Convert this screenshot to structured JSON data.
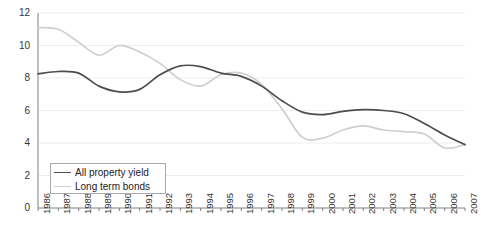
{
  "chart_data": {
    "type": "line",
    "title": "",
    "subtitle": "",
    "xlabel": "",
    "ylabel": "",
    "grid": true,
    "legend_position": "bottom-left",
    "x": [
      1986,
      1987,
      1988,
      1989,
      1990,
      1991,
      1992,
      1993,
      1994,
      1995,
      1996,
      1997,
      1998,
      1999,
      2000,
      2001,
      2002,
      2003,
      2004,
      2005,
      2006,
      2007
    ],
    "categories": [
      "1986",
      "1987",
      "1988",
      "1989",
      "1990",
      "1991",
      "1992",
      "1993",
      "1994",
      "1995",
      "1996",
      "1997",
      "1998",
      "1999",
      "2000",
      "2001",
      "2002",
      "2003",
      "2004",
      "2005",
      "2006",
      "2007"
    ],
    "ylim": [
      0,
      12
    ],
    "yticks": [
      0,
      2,
      4,
      6,
      8,
      10,
      12
    ],
    "ytick_labels": [
      "0",
      "2",
      "4",
      "6",
      "8",
      "10",
      "12"
    ],
    "series": [
      {
        "name": "All property yield",
        "color": "#4d4d4d",
        "values": [
          8.25,
          8.4,
          8.3,
          7.5,
          7.15,
          7.3,
          8.2,
          8.75,
          8.7,
          8.3,
          8.1,
          7.5,
          6.6,
          5.9,
          5.75,
          5.95,
          6.05,
          6.0,
          5.8,
          5.2,
          4.5,
          3.9
        ]
      },
      {
        "name": "Long term bonds",
        "color": "#cfcfcf",
        "values": [
          11.1,
          11.0,
          10.2,
          9.4,
          10.0,
          9.6,
          8.9,
          7.9,
          7.5,
          8.2,
          8.3,
          7.6,
          6.1,
          4.35,
          4.3,
          4.8,
          5.05,
          4.8,
          4.7,
          4.55,
          3.7,
          3.9
        ]
      }
    ]
  },
  "legend": {
    "items": [
      {
        "label": "All property yield",
        "color": "#4d4d4d"
      },
      {
        "label": "Long term bonds",
        "color": "#cfcfcf"
      }
    ]
  },
  "axes": {
    "y": {
      "labels": [
        "12",
        "10",
        "8",
        "6",
        "4",
        "2",
        "0"
      ]
    },
    "x": {
      "labels": [
        "1986",
        "1987",
        "1988",
        "1989",
        "1990",
        "1991",
        "1992",
        "1993",
        "1994",
        "1995",
        "1996",
        "1997",
        "1998",
        "1999",
        "2000",
        "2001",
        "2002",
        "2003",
        "2004",
        "2005",
        "2006",
        "2007"
      ]
    }
  },
  "colors": {
    "axis": "#808080",
    "grid": "#ededed",
    "series_dark": "#4d4d4d",
    "series_light": "#cfcfcf",
    "text": "#333333",
    "legend_border": "#a9a9a9"
  }
}
